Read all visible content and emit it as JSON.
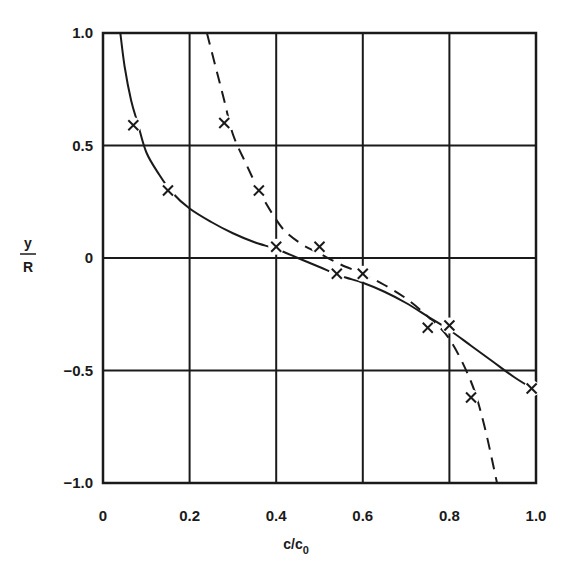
{
  "chart_data": {
    "type": "line",
    "title": "",
    "xlabel": "c/c0",
    "xlabel_main": "c/c",
    "xlabel_sub": "0",
    "ylabel": "y/R",
    "ylabel_num": "y",
    "ylabel_den": "R",
    "xlim": [
      0,
      1.0
    ],
    "ylim": [
      -1.0,
      1.0
    ],
    "grid": true,
    "legend": null,
    "x_ticks": [
      {
        "value": 0,
        "label": "0"
      },
      {
        "value": 0.2,
        "label": "0.2"
      },
      {
        "value": 0.4,
        "label": "0.4"
      },
      {
        "value": 0.6,
        "label": "0.6"
      },
      {
        "value": 0.8,
        "label": "0.8"
      },
      {
        "value": 1.0,
        "label": "1.0"
      }
    ],
    "y_ticks": [
      {
        "value": 1.0,
        "label": "1.0"
      },
      {
        "value": 0.5,
        "label": "0.5"
      },
      {
        "value": 0,
        "label": "0"
      },
      {
        "value": -0.5,
        "label": "−0.5"
      },
      {
        "value": -1.0,
        "label": "−1.0"
      }
    ],
    "series": [
      {
        "name": "solid curve",
        "style": "solid",
        "curve": [
          [
            0.04,
            1.0
          ],
          [
            0.05,
            0.85
          ],
          [
            0.065,
            0.7
          ],
          [
            0.08,
            0.6
          ],
          [
            0.1,
            0.47
          ],
          [
            0.13,
            0.37
          ],
          [
            0.16,
            0.29
          ],
          [
            0.2,
            0.22
          ],
          [
            0.25,
            0.16
          ],
          [
            0.3,
            0.11
          ],
          [
            0.35,
            0.07
          ],
          [
            0.4,
            0.04
          ],
          [
            0.45,
            0.0
          ],
          [
            0.5,
            -0.04
          ],
          [
            0.55,
            -0.08
          ],
          [
            0.6,
            -0.11
          ],
          [
            0.65,
            -0.15
          ],
          [
            0.7,
            -0.2
          ],
          [
            0.75,
            -0.26
          ],
          [
            0.8,
            -0.32
          ],
          [
            0.85,
            -0.39
          ],
          [
            0.9,
            -0.46
          ],
          [
            0.95,
            -0.53
          ],
          [
            1.0,
            -0.59
          ]
        ],
        "markers": [
          {
            "x": 0.07,
            "y": 0.59
          },
          {
            "x": 0.15,
            "y": 0.3
          },
          {
            "x": 0.4,
            "y": 0.05
          },
          {
            "x": 0.54,
            "y": -0.07
          },
          {
            "x": 0.75,
            "y": -0.31
          },
          {
            "x": 0.99,
            "y": -0.58
          }
        ]
      },
      {
        "name": "dashed curve",
        "style": "dashed",
        "curve": [
          [
            0.24,
            1.0
          ],
          [
            0.26,
            0.85
          ],
          [
            0.28,
            0.7
          ],
          [
            0.3,
            0.55
          ],
          [
            0.33,
            0.42
          ],
          [
            0.36,
            0.3
          ],
          [
            0.39,
            0.2
          ],
          [
            0.42,
            0.12
          ],
          [
            0.46,
            0.06
          ],
          [
            0.5,
            0.02
          ],
          [
            0.55,
            -0.03
          ],
          [
            0.6,
            -0.07
          ],
          [
            0.65,
            -0.12
          ],
          [
            0.7,
            -0.18
          ],
          [
            0.75,
            -0.26
          ],
          [
            0.8,
            -0.36
          ],
          [
            0.85,
            -0.55
          ],
          [
            0.88,
            -0.74
          ],
          [
            0.91,
            -1.0
          ]
        ],
        "markers": [
          {
            "x": 0.28,
            "y": 0.6
          },
          {
            "x": 0.36,
            "y": 0.3
          },
          {
            "x": 0.5,
            "y": 0.05
          },
          {
            "x": 0.6,
            "y": -0.07
          },
          {
            "x": 0.8,
            "y": -0.3
          },
          {
            "x": 0.85,
            "y": -0.62
          }
        ]
      }
    ]
  },
  "plot_area": {
    "left": 103,
    "top": 33,
    "right": 536,
    "bottom": 483
  },
  "colors": {
    "ink": "#1a1a1a",
    "background": "#ffffff"
  }
}
